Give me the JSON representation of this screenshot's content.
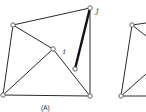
{
  "figure": {
    "caption_a": "(A)",
    "node_labels": {
      "i": "i",
      "j": "j"
    },
    "colors": {
      "edge": "#2a2a2a",
      "bold_edge": "#111111",
      "node_fill": "#ffffff",
      "node_stroke": "#555555",
      "background": "#ffffff"
    },
    "graph_a": {
      "nodes": [
        {
          "id": "tl",
          "x": 13,
          "y": 25
        },
        {
          "id": "j",
          "x": 90,
          "y": 8
        },
        {
          "id": "i",
          "x": 53,
          "y": 49
        },
        {
          "id": "m",
          "x": 75,
          "y": 69
        },
        {
          "id": "bl",
          "x": 3,
          "y": 95
        },
        {
          "id": "br",
          "x": 90,
          "y": 96
        }
      ],
      "edges": [
        [
          "tl",
          "j"
        ],
        [
          "tl",
          "bl"
        ],
        [
          "tl",
          "i"
        ],
        [
          "i",
          "bl"
        ],
        [
          "i",
          "br"
        ],
        [
          "bl",
          "br"
        ],
        [
          "j",
          "br"
        ]
      ],
      "bold_edges": [
        [
          "j",
          "m"
        ]
      ]
    },
    "graph_b_partial": {
      "nodes": [
        {
          "id": "tl2",
          "x": 132,
          "y": 25
        },
        {
          "id": "bl2",
          "x": 121,
          "y": 96
        }
      ]
    }
  }
}
